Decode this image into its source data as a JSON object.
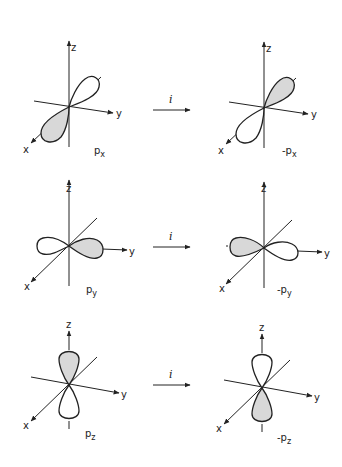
{
  "operation_label": "i",
  "axes": {
    "x": "x",
    "y": "y",
    "z": "z"
  },
  "colors": {
    "shaded_lobe": "#d8d8d8",
    "line": "#222222",
    "background": "#ffffff"
  },
  "rows": [
    {
      "before": {
        "label": "p",
        "subscript": "x"
      },
      "after": {
        "label": "-p",
        "subscript": "x"
      }
    },
    {
      "before": {
        "label": "p",
        "subscript": "y"
      },
      "after": {
        "label": "-p",
        "subscript": "y"
      }
    },
    {
      "before": {
        "label": "p",
        "subscript": "z"
      },
      "after": {
        "label": "-p",
        "subscript": "z"
      }
    }
  ]
}
